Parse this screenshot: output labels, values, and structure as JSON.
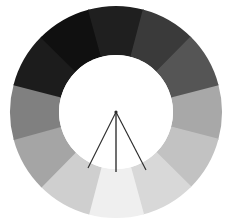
{
  "chart": {
    "title": "",
    "subtitle": "",
    "background_color": "#ffffff"
  },
  "chart_data": {
    "type": "pie",
    "variant": "donut",
    "title": "",
    "subtitle": "",
    "xlabel": "",
    "ylabel": "",
    "legend": [],
    "legend_position": "none",
    "grid": false,
    "annotations": [],
    "geometry": {
      "center_x": 116,
      "center_y": 112,
      "outer_radius": 106,
      "inner_radius": 57,
      "segment_count": 12,
      "segment_angle_degrees": 30,
      "start_angle_degrees": -15,
      "direction": "clockwise"
    },
    "categories": [
      "seg-01",
      "seg-02",
      "seg-03",
      "seg-04",
      "seg-05",
      "seg-06",
      "seg-07",
      "seg-08",
      "seg-09",
      "seg-10",
      "seg-11",
      "seg-12"
    ],
    "values": [
      30,
      30,
      30,
      30,
      30,
      30,
      30,
      30,
      30,
      30,
      30,
      30
    ],
    "colors": [
      "#a8a8a8",
      "#c2c2c2",
      "#d8d8d8",
      "#efefef",
      "#cfcfcf",
      "#a5a5a5",
      "#808080",
      "#1c1c1c",
      "#101010",
      "#1f1f1f",
      "#3a3a3a",
      "#555555"
    ],
    "series": [
      {
        "name": "grayscale-wheel",
        "values": [
          30,
          30,
          30,
          30,
          30,
          30,
          30,
          30,
          30,
          30,
          30,
          30
        ]
      }
    ],
    "pointers": {
      "apex_x": 116,
      "apex_y": 112,
      "line_color": "#2b2b2b",
      "lines": [
        {
          "name": "pointer-left",
          "end_x": 88,
          "end_y": 168,
          "angle_degrees": -117
        },
        {
          "name": "pointer-center",
          "end_x": 116,
          "end_y": 172,
          "angle_degrees": -90
        },
        {
          "name": "pointer-right",
          "end_x": 146,
          "end_y": 170,
          "angle_degrees": -62
        }
      ]
    }
  }
}
